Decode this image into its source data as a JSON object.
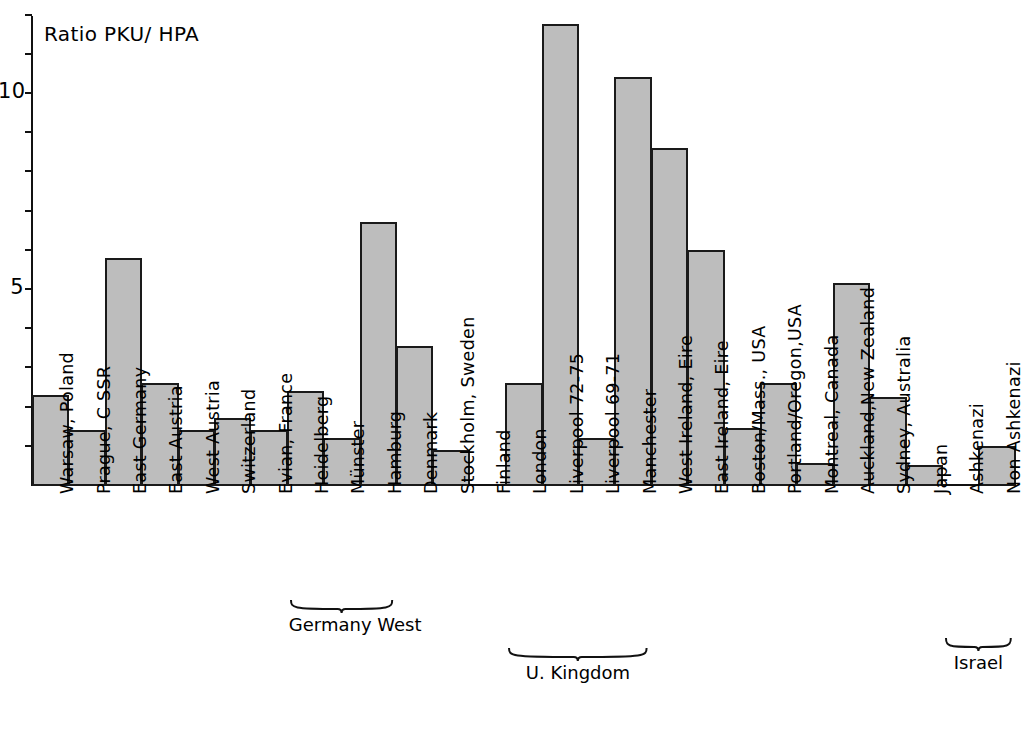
{
  "chart_data": {
    "type": "bar",
    "title": "Ratio PKU/ HPA",
    "xlabel": "",
    "ylabel": "Ratio PKU/ HPA",
    "ylim": [
      0,
      12.2
    ],
    "grid": false,
    "legend": null,
    "y_ticks": [
      {
        "value": 1,
        "label": ""
      },
      {
        "value": 2,
        "label": ""
      },
      {
        "value": 3,
        "label": ""
      },
      {
        "value": 4,
        "label": ""
      },
      {
        "value": 5,
        "label": "5"
      },
      {
        "value": 6,
        "label": ""
      },
      {
        "value": 7,
        "label": ""
      },
      {
        "value": 8,
        "label": ""
      },
      {
        "value": 9,
        "label": ""
      },
      {
        "value": 10,
        "label": "10"
      },
      {
        "value": 11,
        "label": ""
      },
      {
        "value": 12,
        "label": ""
      }
    ],
    "categories": [
      "Warsaw,  Poland",
      "Prague,  C SSR",
      "East Germany",
      "East Austria",
      "West Austria",
      "Switzerland",
      "Evian, France",
      "Heidelberg",
      "Münster",
      "Hamburg",
      "Denmark",
      "Stockholm, Sweden",
      "Finland",
      "London",
      "Liverpool 72-75",
      "Liverpool 69-71",
      "Manchester",
      "West Ireland, Eire",
      "East Ireland, Eire",
      "Boston/Mass., USA",
      "Portland/Oregon,USA",
      "Montreal, Canada",
      "Auckland,New Zealand",
      "Sydney, Australia",
      "Japan",
      "Ashkenazi",
      "Non Ashkenazi"
    ],
    "values": [
      2.3,
      1.4,
      5.8,
      2.6,
      1.4,
      1.7,
      1.4,
      2.4,
      1.2,
      6.7,
      3.55,
      0.9,
      0,
      2.6,
      11.75,
      1.2,
      10.4,
      8.6,
      6.0,
      1.45,
      2.6,
      0.55,
      5.15,
      2.25,
      0.5,
      0,
      1.0
    ],
    "group_braces": [
      {
        "label": "Germany West",
        "from": "Heidelberg",
        "to": "Hamburg"
      },
      {
        "label": "U. Kingdom",
        "from": "London",
        "to": "Manchester"
      },
      {
        "label": "Israel",
        "from": "Ashkenazi",
        "to": "Non Ashkenazi"
      }
    ]
  }
}
